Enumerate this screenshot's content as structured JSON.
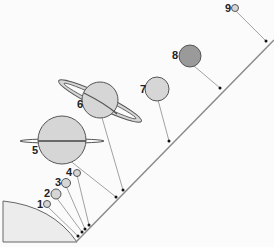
{
  "diagram": {
    "title": "",
    "colors": {
      "planet_fill": "#d6d6d6",
      "planet8_fill": "#9a9a9a",
      "outline": "#555555",
      "line": "#8a8a8a",
      "sun_fill": "#ececec"
    },
    "planets": [
      {
        "label": "1",
        "cx": 47,
        "cy": 204,
        "r": 3.5,
        "dot": [
          78,
          236
        ]
      },
      {
        "label": "2",
        "cx": 56,
        "cy": 194,
        "r": 5,
        "dot": [
          82,
          232
        ]
      },
      {
        "label": "3",
        "cx": 66,
        "cy": 183,
        "r": 4.5,
        "dot": [
          85,
          229
        ]
      },
      {
        "label": "4",
        "cx": 77,
        "cy": 173,
        "r": 3.5,
        "dot": [
          89,
          225
        ]
      },
      {
        "label": "5",
        "cx": 62,
        "cy": 140,
        "r": 24,
        "dot": [
          116,
          197
        ]
      },
      {
        "label": "6",
        "cx": 100,
        "cy": 100,
        "r": 18,
        "dot": [
          123,
          190
        ]
      },
      {
        "label": "7",
        "cx": 157,
        "cy": 89,
        "r": 12,
        "dot": [
          169,
          141
        ]
      },
      {
        "label": "8",
        "cx": 190,
        "cy": 56,
        "r": 11,
        "dot": [
          220,
          88
        ]
      },
      {
        "label": "9",
        "cx": 235,
        "cy": 8,
        "r": 3.5,
        "dot": [
          266,
          41
        ]
      }
    ]
  }
}
